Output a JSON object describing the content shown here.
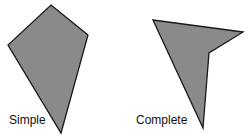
{
  "figures": [
    {
      "label": "Simple",
      "points": "51,5 88,35 61,133 8,45",
      "fill": "#8a8a8a",
      "stroke": "#1a1a1a"
    },
    {
      "label": "Complete",
      "points": "153,20 243,32 209,53 203,128",
      "fill": "#8a8a8a",
      "stroke": "#1a1a1a"
    }
  ]
}
